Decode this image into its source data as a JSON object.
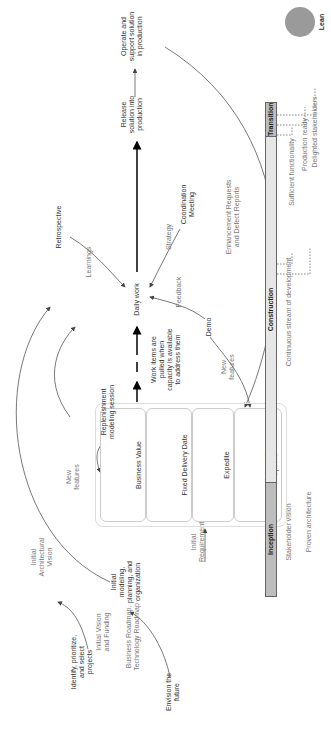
{
  "diagram": {
    "title": "Lean",
    "nodes": {
      "identify": "Identify, prioritize,\nand select\nprojects",
      "envision": "Envision the\nfuture",
      "initial_modeling": "Initial\nmodeling,\nplanning, and\norganization",
      "replenishment": "Replenishment\nmodeling session",
      "work_items": "Work items are\npulled when\ncapacity is available\nto address them",
      "daily_work": "Daily work",
      "retrospective": "Retrospective",
      "coordination": "Coordination\nMeeting",
      "demo": "Demo",
      "release": "Release\nsolution into\nproduction",
      "operate": "Operate and\nsupport solution\nin production"
    },
    "edge_labels": {
      "initial_vision_funding": "Initial Vision\nand Funding",
      "roadmaps": "Business Roadmap,\nTechnology Roadmap",
      "initial_arch_vision": "Initial\nArchitectural\nVision",
      "initial_requirements": "Initial\nRequirements",
      "new_features_top": "New\nfeatures",
      "new_features_demo": "New\nfeatures",
      "learnings": "Learnings",
      "strategy": "Strategy",
      "feedback": "Feedback",
      "enhancements": "Enhancement Requests\nand Defect Reports"
    },
    "lanes": [
      {
        "label": "Business Value"
      },
      {
        "label": "Fixed Delivery Date"
      },
      {
        "label": "Expedite"
      },
      {
        "label": "Intangible\nOptions"
      }
    ],
    "phases": [
      {
        "label": "Inception"
      },
      {
        "label": "Construction"
      },
      {
        "label": "Transition"
      }
    ],
    "milestones": {
      "stakeholder_vision": "Stakeholder vision",
      "proven_architecture": "Proven architecture",
      "continuous_stream": "Continuous stream of development",
      "sufficient_functionality": "Sufficient functionality",
      "production_ready": "Production ready",
      "delighted_stakeholders": "Delighted stakeholders"
    }
  }
}
